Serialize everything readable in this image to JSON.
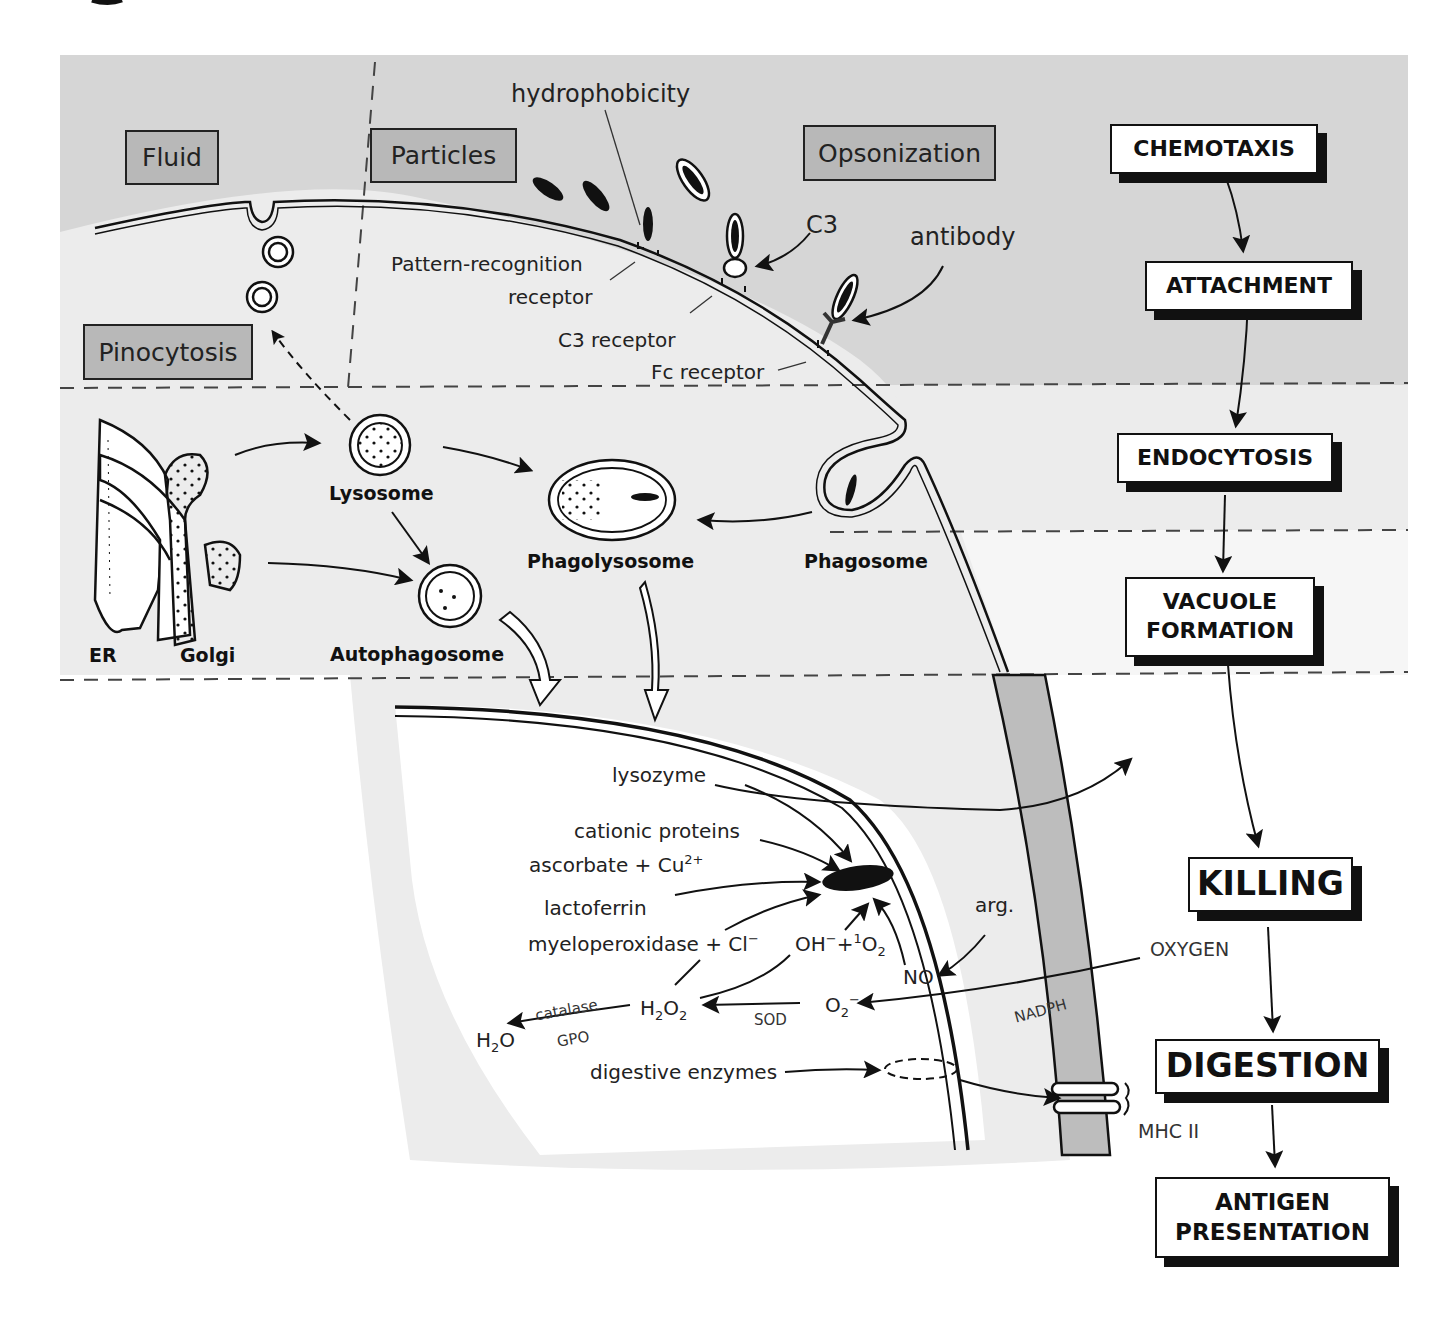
{
  "uptake_types": {
    "fluid": "Fluid",
    "particles": "Particles",
    "opsonization": "Opsonization",
    "pinocytosis": "Pinocytosis"
  },
  "surface_labels": {
    "hydrophobicity": "hydrophobicity",
    "c3": "C3",
    "antibody": "antibody",
    "pattern_recognition_1": "Pattern-recognition",
    "pattern_recognition_2": "receptor",
    "c3_receptor": "C3 receptor",
    "fc_receptor": "Fc receptor"
  },
  "organelles": {
    "lysosome": "Lysosome",
    "phagolysosome": "Phagolysosome",
    "phagosome": "Phagosome",
    "autophagosome": "Autophagosome",
    "er": "ER",
    "golgi": "Golgi"
  },
  "killing_agents": {
    "lysozyme": "lysozyme",
    "cationic_proteins": "cationic proteins",
    "ascorbate": "ascorbate + Cu",
    "ascorbate_sup": "2+",
    "lactoferrin": "lactoferrin",
    "myeloperoxidase": "myeloperoxidase + Cl",
    "myeloperoxidase_sup": "−",
    "oh_part": "OH",
    "oh_sup": "−",
    "singlet_plus": "+",
    "singlet_sup": "1",
    "singlet_o": "O",
    "singlet_sub": "2",
    "no": "NO",
    "arg": "arg.",
    "h2o2_h": "H",
    "h2o2_sub1": "2",
    "h2o2_o": "O",
    "h2o2_sub2": "2",
    "superoxide_o": "O",
    "superoxide_sub": "2",
    "superoxide_sup": "−",
    "h2o_h": "H",
    "h2o_sub": "2",
    "h2o_o": "O",
    "catalase": "catalase",
    "gpo": "GPO",
    "sod": "SOD",
    "nadph": "NADPH",
    "oxygen": "OXYGEN",
    "digestive_enzymes": "digestive enzymes",
    "mhc": "MHC II"
  },
  "steps": [
    {
      "label": "CHEMOTAXIS"
    },
    {
      "label": "ATTACHMENT"
    },
    {
      "label": "ENDOCYTOSIS"
    },
    {
      "label_1": "VACUOLE",
      "label_2": "FORMATION"
    },
    {
      "label": "KILLING"
    },
    {
      "label": "DIGESTION"
    },
    {
      "label_1": "ANTIGEN",
      "label_2": "PRESENTATION"
    }
  ],
  "colors": {
    "extracellular": "#d6d6d6",
    "cytoplasm": "#ececec",
    "label_box": "#b8b8b8",
    "cell_wall": "#bdbdbd",
    "ink": "#111111"
  }
}
